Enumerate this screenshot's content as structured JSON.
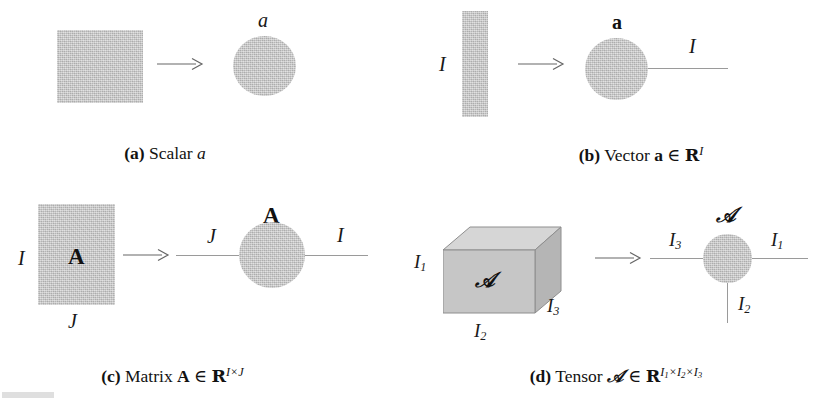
{
  "figure": {
    "kind": "tensor-network-notation-figure",
    "background_color": "#ffffff",
    "shape_fill_color": "#c6c6c6",
    "line_color": "#9a9a9a",
    "text_color": "#121212"
  },
  "panels": [
    {
      "id": "a",
      "caption": {
        "tag": "(a)",
        "word": "Scalar",
        "symbol": "a"
      },
      "source_shape": "square",
      "arrow": "rightwards-arrow",
      "node_label": "a",
      "edges": []
    },
    {
      "id": "b",
      "caption": {
        "tag": "(b)",
        "word": "Vector",
        "symbol": "a",
        "member": "∈",
        "space": "ℝ",
        "superscript": "I"
      },
      "source_shape": "vertical-bar",
      "source_labels": {
        "left": "I"
      },
      "arrow": "rightwards-arrow",
      "node_label": "a",
      "edges": [
        {
          "direction": "right",
          "label": "I"
        }
      ]
    },
    {
      "id": "c",
      "caption": {
        "tag": "(c)",
        "word": "Matrix",
        "symbol": "A",
        "member": "∈",
        "space": "ℝ",
        "superscript": "I×J"
      },
      "source_shape": "rectangle",
      "source_inner_label": "A",
      "source_labels": {
        "left": "I",
        "bottom": "J"
      },
      "arrow": "rightwards-arrow",
      "node_label": "A",
      "edges": [
        {
          "direction": "left",
          "label": "J"
        },
        {
          "direction": "right",
          "label": "I"
        }
      ]
    },
    {
      "id": "d",
      "caption": {
        "tag": "(d)",
        "word": "Tensor",
        "symbol": "𝒜",
        "member": "∈",
        "space": "ℝ",
        "superscript_parts": [
          "I",
          "1",
          "×",
          "I",
          "2",
          "×",
          "I",
          "3"
        ]
      },
      "source_shape": "cube",
      "source_inner_label": "𝒜",
      "source_labels": {
        "left": "I",
        "left_sub": "1",
        "bottom": "I",
        "bottom_sub": "2",
        "right": "I",
        "right_sub": "3"
      },
      "arrow": "rightwards-arrow",
      "node_label": "𝒜",
      "edges": [
        {
          "direction": "left",
          "label": "I",
          "sub": "3"
        },
        {
          "direction": "right",
          "label": "I",
          "sub": "1"
        },
        {
          "direction": "down",
          "label": "I",
          "sub": "2"
        }
      ]
    }
  ],
  "labels": {
    "a_node": "a",
    "b_bar_left": "I",
    "b_node": "a",
    "b_edge_right": "I",
    "c_rect_inner": "A",
    "c_rect_left": "I",
    "c_rect_bottom": "J",
    "c_node": "A",
    "c_edge_left": "J",
    "c_edge_right": "I",
    "d_cube_inner": "𝒜",
    "d_cube_left": "I",
    "d_cube_left_sub": "1",
    "d_cube_bottom": "I",
    "d_cube_bottom_sub": "2",
    "d_cube_right": "I",
    "d_cube_right_sub": "3",
    "d_node": "𝒜",
    "d_edge_left": "I",
    "d_edge_left_sub": "3",
    "d_edge_right": "I",
    "d_edge_right_sub": "1",
    "d_edge_down": "I",
    "d_edge_down_sub": "2"
  },
  "captions": {
    "a": {
      "tag": "(a)",
      "text": "Scalar",
      "sym": "a"
    },
    "b": {
      "tag": "(b)",
      "text": "Vector",
      "sym": "a",
      "mem": "∈",
      "space": "R",
      "sup": "I"
    },
    "c": {
      "tag": "(c)",
      "text": "Matrix",
      "sym": "A",
      "mem": "∈",
      "space": "R",
      "sup_1": "I",
      "sup_x": "×",
      "sup_2": "J"
    },
    "d": {
      "tag": "(d)",
      "text": "Tensor",
      "sym": "𝒜",
      "mem": "∈",
      "space": "R",
      "sup_i1": "I",
      "sup_s1": "1",
      "sup_x1": "×",
      "sup_i2": "I",
      "sup_s2": "2",
      "sup_x2": "×",
      "sup_i3": "I",
      "sup_s3": "3"
    }
  }
}
